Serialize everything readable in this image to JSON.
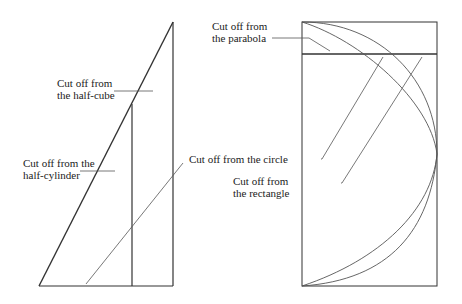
{
  "diagram": {
    "left_figure": {
      "name": "triangle cross-section",
      "labels": {
        "half_cube": [
          "Cut off from",
          "the half-cube"
        ],
        "half_cylinder": [
          "Cut off from the",
          "half-cylinder"
        ],
        "circle": "Cut off from the circle"
      }
    },
    "right_figure": {
      "name": "rectangle with circle and parabola arcs",
      "labels": {
        "parabola": [
          "Cut off from",
          "the parabola"
        ],
        "rectangle": [
          "Cut off from",
          "the rectangle"
        ]
      }
    },
    "colors": {
      "line": "#333333",
      "thin_line": "#555555",
      "text": "#222222"
    }
  }
}
